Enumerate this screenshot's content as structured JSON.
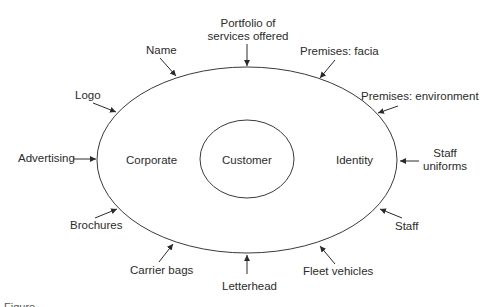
{
  "diagram": {
    "type": "concentric-ellipses-with-inputs",
    "outer_ellipse": {
      "cx": 247,
      "cy": 160,
      "rx": 150,
      "ry": 93,
      "left_label": "Corporate",
      "right_label": "Identity"
    },
    "inner_ellipse": {
      "cx": 247,
      "cy": 159,
      "rx": 47,
      "ry": 39,
      "label": "Customer"
    },
    "inputs": [
      {
        "id": "portfolio",
        "line1": "Portfolio of",
        "line2": "services offered"
      },
      {
        "id": "name",
        "line1": "Name"
      },
      {
        "id": "premises-facia",
        "line1": "Premises: facia"
      },
      {
        "id": "logo",
        "line1": "Logo"
      },
      {
        "id": "premises-environment",
        "line1": "Premises: environment"
      },
      {
        "id": "advertising",
        "line1": "Advertising"
      },
      {
        "id": "staff-uniforms",
        "line1": "Staff",
        "line2": "uniforms"
      },
      {
        "id": "brochures",
        "line1": "Brochures"
      },
      {
        "id": "staff",
        "line1": "Staff"
      },
      {
        "id": "carrier-bags",
        "line1": "Carrier bags"
      },
      {
        "id": "letterhead",
        "line1": "Letterhead"
      },
      {
        "id": "fleet-vehicles",
        "line1": "Fleet vehicles"
      }
    ],
    "stroke_color": "#3a3a3a",
    "text_color": "#2b2b2b",
    "background": "#ffffff"
  },
  "caption": {
    "text": "Figure"
  }
}
